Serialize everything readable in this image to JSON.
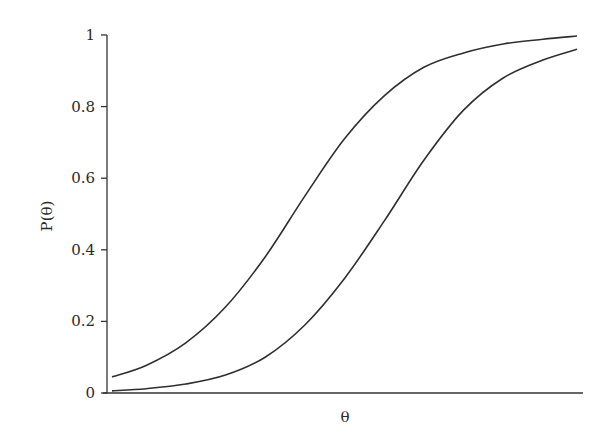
{
  "chart_data": {
    "type": "line",
    "title": "",
    "xlabel": "θ",
    "ylabel": "P(θ)",
    "ylim": [
      0,
      1
    ],
    "xlim": [
      -3,
      3
    ],
    "yticks": [
      "0",
      "0.2",
      "0.4",
      "0.6",
      "0.8",
      "1"
    ],
    "xticks": [],
    "grid": false,
    "legend": null,
    "x": [
      -2.93,
      -2.5,
      -2.0,
      -1.5,
      -1.0,
      -0.5,
      0.0,
      0.5,
      1.0,
      1.5,
      2.0,
      2.5,
      2.93
    ],
    "series": [
      {
        "name": "item-1",
        "values": [
          0.045,
          0.077,
          0.14,
          0.24,
          0.38,
          0.55,
          0.71,
          0.83,
          0.91,
          0.95,
          0.975,
          0.988,
          0.997
        ]
      },
      {
        "name": "item-2",
        "values": [
          0.006,
          0.012,
          0.025,
          0.05,
          0.1,
          0.19,
          0.32,
          0.48,
          0.65,
          0.79,
          0.88,
          0.93,
          0.96
        ]
      }
    ]
  }
}
